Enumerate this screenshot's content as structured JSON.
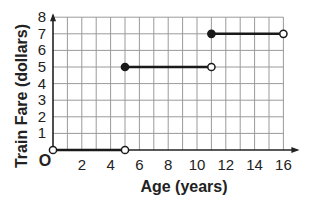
{
  "chart_data": {
    "type": "line",
    "subtype": "step-function",
    "title": "",
    "xlabel": "Age (years)",
    "ylabel": "Train Fare (dollars)",
    "origin_label": "O",
    "xlim": [
      0,
      16
    ],
    "ylim": [
      0,
      8
    ],
    "x_ticks": [
      "2",
      "4",
      "6",
      "8",
      "10",
      "12",
      "14",
      "16"
    ],
    "y_ticks": [
      "1",
      "2",
      "3",
      "4",
      "5",
      "6",
      "7",
      "8"
    ],
    "grid": true,
    "segments": [
      {
        "x_start": 0,
        "x_end": 5,
        "y": 0,
        "start_closed": false,
        "end_closed": false
      },
      {
        "x_start": 5,
        "x_end": 11,
        "y": 5,
        "start_closed": true,
        "end_closed": false
      },
      {
        "x_start": 11,
        "x_end": 16,
        "y": 7,
        "start_closed": true,
        "end_closed": false
      }
    ]
  }
}
